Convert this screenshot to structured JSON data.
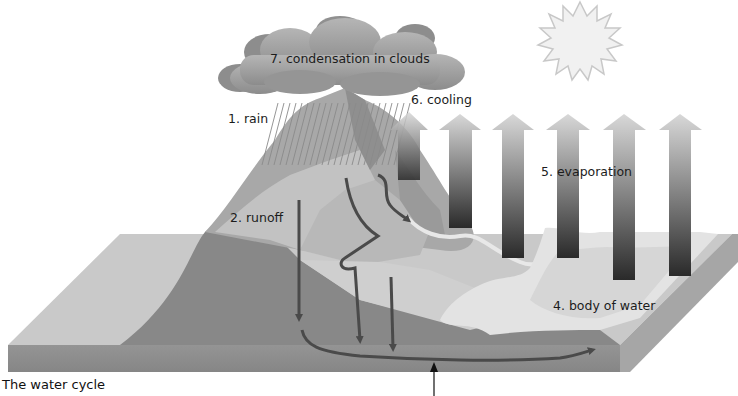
{
  "figure": {
    "caption": "The water cycle",
    "labels": {
      "rain": "1. rain",
      "runoff": "2. runoff",
      "body_of_water": "4. body of water",
      "evaporation": "5. evaporation",
      "cooling": "6. cooling",
      "condensation": "7. condensation in clouds"
    },
    "stages": [
      {
        "step": 1,
        "name": "rain"
      },
      {
        "step": 2,
        "name": "runoff"
      },
      {
        "step": 4,
        "name": "body of water"
      },
      {
        "step": 5,
        "name": "evaporation"
      },
      {
        "step": 6,
        "name": "cooling"
      },
      {
        "step": 7,
        "name": "condensation in clouds"
      }
    ],
    "icons": [
      "sun-icon",
      "cloud-icon",
      "rain-icon",
      "evaporation-arrow-icon",
      "flow-arrow-icon",
      "pointer-arrow-icon"
    ],
    "colors": {
      "background": "#ffffff",
      "land_top": "#c9c9c9",
      "land_side": "#8e8e8e",
      "mountain_dark": "#8a8a8a",
      "mountain_mid": "#a9a9a9",
      "mountain_light": "#c4c4c4",
      "water": "#e3e3e3",
      "arrow": "#4a4a4a",
      "cloud": "#9c9c9c",
      "sun": "#f1f1f1"
    }
  }
}
